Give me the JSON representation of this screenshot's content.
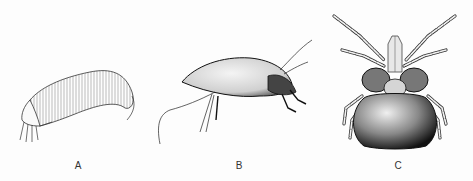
{
  "figure": {
    "panels": [
      {
        "label": "A",
        "subject": "elongated mite, lateral view (finely striated body)"
      },
      {
        "label": "B",
        "subject": "oval mite, lateral view with long setae"
      },
      {
        "label": "C",
        "subject": "rounded mite, dorsal view with eight legs"
      }
    ],
    "colors": {
      "background": "#fdfdfd",
      "ink": "#1a1a1a",
      "label": "#333333"
    }
  }
}
